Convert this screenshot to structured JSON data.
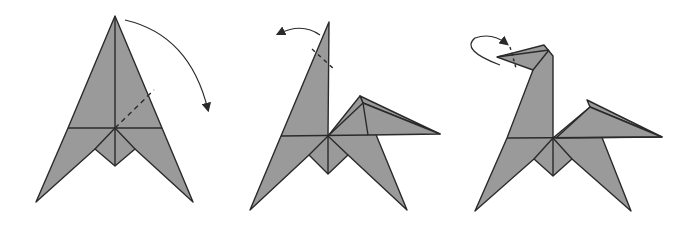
{
  "diagram": {
    "colors": {
      "paper_fill": "#9a9a9a",
      "line": "#2a2a2a",
      "background": "#ffffff"
    },
    "steps": [
      {
        "index": 1,
        "description": "Fold the top point down along dashed line",
        "arrow": "valley-fold-arrow-right"
      },
      {
        "index": 2,
        "description": "Fold the tip back along dashed line",
        "arrow": "fold-arrow-left"
      },
      {
        "index": 3,
        "description": "Inside reverse fold the head",
        "arrow": "reverse-fold-arrow"
      }
    ]
  }
}
